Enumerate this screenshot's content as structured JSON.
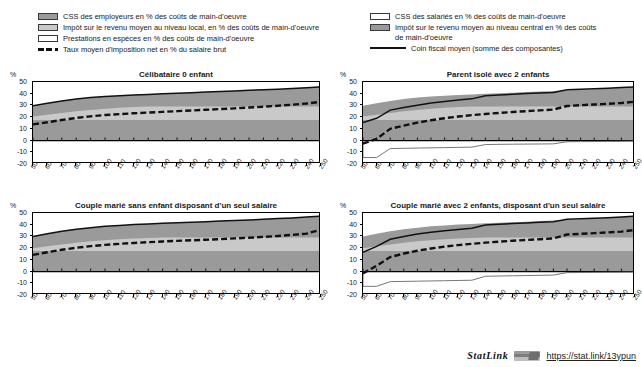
{
  "legend_left": {
    "items": [
      {
        "icon": "swatch-dark",
        "label": "CSS des employeurs en % des coûts de main-d'oeuvre"
      },
      {
        "icon": "swatch-mid",
        "label": "Impôt sur le revenu moyen au niveau local, en % des coûts de main-d'oeuvre"
      },
      {
        "icon": "swatch-light",
        "label": "Prestations en espèces en % des coûts de main-d'oeuvre"
      },
      {
        "icon": "dashed-line",
        "label": "Taux moyen d'imposition net en % du salaire brut"
      }
    ]
  },
  "legend_right": {
    "items": [
      {
        "icon": "swatch-light",
        "label": "CSS des salariés en % des coûts de main-d'oeuvre"
      },
      {
        "icon": "swatch-dark",
        "label": "Impôt sur le revenu moyen au niveau central en %  des coûts de main-d'oeuvre"
      },
      {
        "icon": "solid-line",
        "label": "Coin fiscal moyen (somme des composantes)"
      }
    ]
  },
  "footer": {
    "statlink_word": "StatLink",
    "icon": "statlink-barcode-icon",
    "url": "https://stat.link/13ypun"
  },
  "axis": {
    "unit": "%",
    "y_ticks": [
      50,
      40,
      30,
      20,
      10,
      0,
      -10,
      -20
    ],
    "y_min": -20,
    "y_max": 50,
    "x_ticks": [
      50,
      60,
      70,
      80,
      90,
      100,
      110,
      120,
      130,
      140,
      150,
      160,
      170,
      180,
      190,
      200,
      210,
      220,
      230,
      240,
      250
    ],
    "x_min": 50,
    "x_max": 250
  },
  "colors": {
    "dark_grey": "#9a9a9a",
    "mid_grey": "#c9c9c9",
    "white": "#ffffff",
    "line": "#111111"
  },
  "chart_data": [
    {
      "id": "celibataire-0-enfant",
      "type": "area",
      "title": "Célibataire 0 enfant",
      "xlabel": "",
      "ylabel": "%",
      "xlim": [
        50,
        250
      ],
      "ylim": [
        -20,
        50
      ],
      "grid": false,
      "x": [
        50,
        60,
        70,
        80,
        90,
        100,
        110,
        120,
        130,
        140,
        150,
        160,
        170,
        180,
        190,
        200,
        210,
        220,
        230,
        240,
        250
      ],
      "series": [
        {
          "name": "Impôt sur le revenu moyen au niveau central en % des coûts de main-d'oeuvre",
          "values": [
            17.5,
            17.5,
            17.5,
            17.5,
            17.5,
            17.5,
            17.5,
            17.5,
            17.5,
            17.5,
            17.5,
            17.5,
            17.5,
            17.5,
            17.5,
            17.5,
            17.5,
            17.5,
            17.5,
            17.5,
            17.5
          ]
        },
        {
          "name": "Impôt sur le revenu moyen au niveau local, en % des coûts de main-d'oeuvre",
          "values": [
            20.5,
            22.0,
            23.6,
            25.0,
            26.2,
            27.2,
            28.0,
            28.6,
            29.0,
            29.0,
            29.0,
            29.0,
            29.0,
            29.0,
            29.0,
            29.0,
            29.0,
            29.0,
            29.0,
            29.0,
            29.0
          ]
        },
        {
          "name": "CSS des employeurs en % des coûts de main-d'oeuvre",
          "values": [
            29.8,
            31.8,
            33.8,
            35.4,
            36.7,
            37.6,
            38.3,
            38.9,
            39.4,
            39.9,
            40.4,
            40.9,
            41.4,
            41.9,
            42.4,
            42.9,
            43.4,
            43.9,
            44.5,
            45.1,
            45.8
          ]
        }
      ],
      "lines": [
        {
          "name": "Coin fiscal moyen (somme des composantes)",
          "style": "solid",
          "values": [
            29.8,
            31.8,
            33.8,
            35.4,
            36.7,
            37.6,
            38.3,
            38.9,
            39.4,
            39.9,
            40.4,
            40.9,
            41.4,
            41.9,
            42.4,
            42.9,
            43.4,
            43.9,
            44.5,
            45.1,
            45.8
          ]
        },
        {
          "name": "Taux moyen d'imposition net en % du salaire brut",
          "style": "dashed",
          "values": [
            13.8,
            15.6,
            17.6,
            19.3,
            20.7,
            21.8,
            22.6,
            23.3,
            23.9,
            24.5,
            25.1,
            25.7,
            26.3,
            26.9,
            27.5,
            28.2,
            28.9,
            29.7,
            30.6,
            31.6,
            33.2
          ]
        }
      ],
      "negative_line": null
    },
    {
      "id": "parent-isole-2-enfants",
      "type": "area",
      "title": "Parent isolé avec 2 enfants",
      "xlabel": "",
      "ylabel": "%",
      "xlim": [
        50,
        250
      ],
      "ylim": [
        -20,
        50
      ],
      "grid": false,
      "x": [
        50,
        60,
        70,
        80,
        90,
        100,
        110,
        120,
        130,
        140,
        150,
        160,
        170,
        180,
        190,
        200,
        210,
        220,
        230,
        240,
        250
      ],
      "series": [
        {
          "name": "Impôt sur le revenu moyen au niveau central en % des coûts de main-d'oeuvre",
          "values": [
            17.5,
            17.5,
            17.5,
            17.5,
            17.5,
            17.5,
            17.5,
            17.5,
            17.5,
            17.5,
            17.5,
            17.5,
            17.5,
            17.5,
            17.5,
            17.5,
            17.5,
            17.5,
            17.5,
            17.5,
            17.5
          ]
        },
        {
          "name": "Impôt sur le revenu moyen au niveau local, en % des coûts de main-d'oeuvre",
          "values": [
            20.5,
            22.0,
            23.6,
            25.0,
            26.2,
            27.2,
            28.0,
            28.6,
            29.0,
            29.0,
            29.0,
            29.0,
            29.0,
            29.0,
            29.0,
            29.0,
            29.0,
            29.0,
            29.0,
            29.0,
            29.0
          ]
        },
        {
          "name": "CSS des employeurs en % des coûts de main-d'oeuvre",
          "values": [
            29.8,
            31.8,
            33.8,
            35.4,
            36.7,
            37.6,
            38.3,
            38.9,
            39.4,
            39.9,
            40.4,
            40.9,
            41.4,
            41.9,
            42.4,
            42.9,
            43.4,
            43.9,
            44.5,
            45.1,
            45.8
          ]
        }
      ],
      "lines": [
        {
          "name": "Coin fiscal moyen (somme des composantes)",
          "style": "solid",
          "values": [
            15.5,
            19.0,
            26.0,
            28.2,
            30.2,
            32.0,
            33.4,
            34.6,
            35.6,
            38.2,
            38.9,
            39.5,
            40.1,
            40.6,
            41.1,
            43.3,
            43.8,
            44.2,
            44.7,
            45.2,
            45.8
          ]
        },
        {
          "name": "Taux moyen d'imposition net en % du salaire brut",
          "style": "dashed",
          "values": [
            -2.5,
            1.5,
            10.0,
            12.8,
            15.3,
            17.4,
            19.1,
            20.5,
            21.7,
            22.7,
            23.6,
            24.4,
            25.1,
            25.8,
            26.5,
            29.5,
            30.2,
            30.8,
            31.4,
            32.1,
            33.2
          ]
        }
      ],
      "negative_line": {
        "name": "Prestations en espèces en % des coûts de main-d'oeuvre",
        "style": "thin",
        "values": [
          -14.5,
          -14.5,
          -6.8,
          -6.6,
          -6.4,
          -6.2,
          -6.0,
          -5.8,
          -5.6,
          -3.4,
          -3.2,
          -3.1,
          -3.0,
          -2.9,
          -2.8,
          -1.0,
          -0.9,
          -0.8,
          -0.7,
          -0.6,
          -0.5
        ]
      }
    },
    {
      "id": "couple-marie-sans-enfant",
      "type": "area",
      "title": "Couple marié sans enfant disposant d'un seul salaire",
      "xlabel": "",
      "ylabel": "%",
      "xlim": [
        50,
        250
      ],
      "ylim": [
        -20,
        50
      ],
      "grid": false,
      "x": [
        50,
        60,
        70,
        80,
        90,
        100,
        110,
        120,
        130,
        140,
        150,
        160,
        170,
        180,
        190,
        200,
        210,
        220,
        230,
        240,
        250
      ],
      "series": [
        {
          "name": "Impôt sur le revenu moyen au niveau central en % des coûts de main-d'oeuvre",
          "values": [
            17.5,
            17.5,
            17.5,
            17.5,
            17.5,
            17.5,
            17.5,
            17.5,
            17.5,
            17.5,
            17.5,
            17.5,
            17.5,
            17.5,
            17.5,
            17.5,
            17.5,
            17.5,
            17.5,
            17.5,
            17.5
          ]
        },
        {
          "name": "Impôt sur le revenu moyen au niveau local, en % des coûts de main-d'oeuvre",
          "values": [
            20.0,
            21.6,
            23.2,
            24.6,
            25.8,
            26.8,
            27.6,
            28.2,
            28.7,
            29.0,
            29.0,
            29.0,
            29.0,
            29.0,
            29.0,
            29.0,
            29.0,
            29.0,
            29.0,
            29.0,
            29.0
          ]
        },
        {
          "name": "CSS des employeurs en % des coûts de main-d'oeuvre",
          "values": [
            30.0,
            32.3,
            34.4,
            36.1,
            37.5,
            38.6,
            39.4,
            40.1,
            40.7,
            41.2,
            41.7,
            42.2,
            42.6,
            43.1,
            43.6,
            44.1,
            44.6,
            45.2,
            45.8,
            46.5,
            47.4
          ]
        }
      ],
      "lines": [
        {
          "name": "Coin fiscal moyen (somme des composantes)",
          "style": "solid",
          "values": [
            30.0,
            32.3,
            34.4,
            36.1,
            37.5,
            38.6,
            39.4,
            40.1,
            40.7,
            41.2,
            41.7,
            42.2,
            42.6,
            43.1,
            43.6,
            44.1,
            44.6,
            45.2,
            45.8,
            46.5,
            47.4
          ]
        },
        {
          "name": "Taux moyen d'imposition net en % du salaire brut",
          "style": "dashed",
          "values": [
            14.2,
            16.5,
            18.6,
            20.3,
            21.7,
            22.8,
            23.7,
            24.4,
            25.1,
            25.7,
            26.2,
            26.7,
            27.2,
            27.7,
            28.3,
            28.9,
            29.6,
            30.4,
            31.3,
            32.4,
            35.8
          ]
        }
      ],
      "negative_line": null
    },
    {
      "id": "couple-marie-2-enfants",
      "type": "area",
      "title": "Couple marié avec 2 enfants, disposant d'un seul salaire",
      "xlabel": "",
      "ylabel": "%",
      "xlim": [
        50,
        250
      ],
      "ylim": [
        -20,
        50
      ],
      "grid": false,
      "x": [
        50,
        60,
        70,
        80,
        90,
        100,
        110,
        120,
        130,
        140,
        150,
        160,
        170,
        180,
        190,
        200,
        210,
        220,
        230,
        240,
        250
      ],
      "series": [
        {
          "name": "Impôt sur le revenu moyen au niveau central en % des coûts de main-d'oeuvre",
          "values": [
            17.5,
            17.5,
            17.5,
            17.5,
            17.5,
            17.5,
            17.5,
            17.5,
            17.5,
            17.5,
            17.5,
            17.5,
            17.5,
            17.5,
            17.5,
            17.5,
            17.5,
            17.5,
            17.5,
            17.5,
            17.5
          ]
        },
        {
          "name": "Impôt sur le revenu moyen au niveau local, en % des coûts de main-d'oeuvre",
          "values": [
            20.0,
            21.6,
            23.2,
            24.6,
            25.8,
            26.8,
            27.6,
            28.2,
            28.7,
            29.0,
            29.0,
            29.0,
            29.0,
            29.0,
            29.0,
            29.0,
            29.0,
            29.0,
            29.0,
            29.0,
            29.0
          ]
        },
        {
          "name": "CSS des employeurs en % des coûts de main-d'oeuvre",
          "values": [
            30.0,
            32.3,
            34.4,
            36.1,
            37.5,
            38.6,
            39.4,
            40.1,
            40.7,
            41.2,
            41.7,
            42.2,
            42.6,
            43.1,
            43.6,
            44.1,
            44.6,
            45.2,
            45.8,
            46.5,
            47.4
          ]
        }
      ],
      "lines": [
        {
          "name": "Coin fiscal moyen (somme des composantes)",
          "style": "solid",
          "values": [
            16.5,
            21.5,
            27.6,
            30.0,
            32.0,
            33.6,
            34.9,
            36.0,
            36.9,
            39.8,
            40.4,
            41.0,
            41.5,
            42.0,
            42.5,
            44.6,
            45.0,
            45.5,
            46.0,
            46.6,
            47.4
          ]
        },
        {
          "name": "Taux moyen d'imposition net en % du salaire brut",
          "style": "dashed",
          "values": [
            -1.5,
            5.0,
            12.4,
            15.4,
            17.8,
            19.7,
            21.3,
            22.6,
            23.7,
            24.7,
            25.5,
            26.3,
            27.0,
            27.6,
            28.3,
            31.6,
            32.2,
            32.8,
            33.4,
            34.1,
            35.5
          ]
        }
      ],
      "negative_line": {
        "name": "Prestations en espèces en % des coûts de main-d'oeuvre",
        "style": "thin",
        "values": [
          -12.6,
          -12.6,
          -8.6,
          -8.4,
          -8.2,
          -8.0,
          -7.8,
          -7.6,
          -7.4,
          -4.0,
          -3.8,
          -3.6,
          -3.4,
          -3.2,
          -3.0,
          -0.9,
          -0.8,
          -0.7,
          -0.6,
          -0.5,
          -0.4
        ]
      }
    }
  ]
}
